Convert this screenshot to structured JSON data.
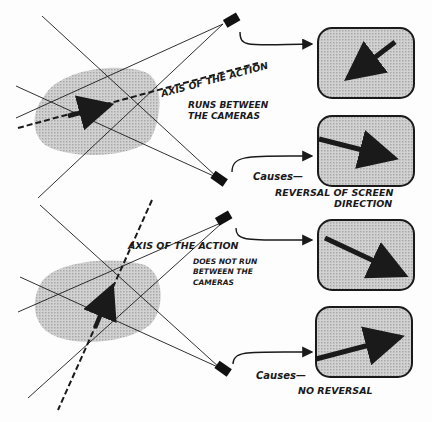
{
  "diagram": {
    "top_panel": {
      "axis_label": "AXIS OF THE ACTION",
      "condition_line1": "RUNS BETWEEN",
      "condition_line2": "THE CAMERAS",
      "causes_label": "Causes—",
      "result_line1": "REVERSAL OF SCREEN",
      "result_line2": "DIRECTION",
      "screen1_arrow": "arrow-down-left",
      "screen2_arrow": "arrow-down-right"
    },
    "bottom_panel": {
      "axis_label": "AXIS OF THE ACTION",
      "condition_line1": "DOES NOT RUN",
      "condition_line2": "BETWEEN THE",
      "condition_line3": "CAMERAS",
      "causes_label": "Causes—",
      "result_line1": "NO  REVERSAL",
      "screen1_arrow": "arrow-down-right",
      "screen2_arrow": "arrow-up-right"
    },
    "colors": {
      "ink": "#1a1a1a",
      "shading": "#c4c4c4",
      "background": "#fdfdfd"
    }
  }
}
